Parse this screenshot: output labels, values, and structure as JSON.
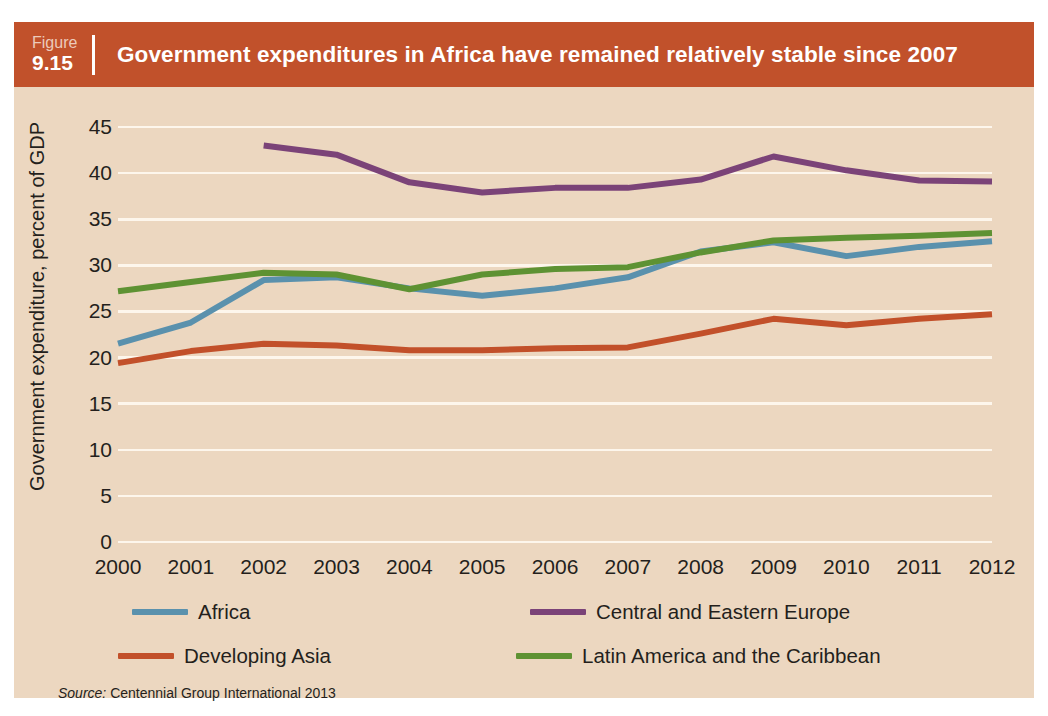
{
  "figure": {
    "label_word": "Figure",
    "number": "9.15",
    "title": "Government expenditures in Africa have remained relatively stable since 2007"
  },
  "source": {
    "keyword": "Source:",
    "text": "Centennial Group International 2013"
  },
  "colors": {
    "header_band": "#c1512b",
    "panel_background": "#ecd7c0",
    "gridline": "#fdf6ec",
    "text": "#241f1c",
    "africa": "#5a91ad",
    "central_and_eastern_europe": "#7b4378",
    "developing_asia": "#c2502a",
    "latin_america_and_the_caribbean": "#5e9233"
  },
  "chart_data": {
    "type": "line",
    "title": "Government expenditures in Africa have remained relatively stable since 2007",
    "xlabel": "",
    "ylabel": "Government expenditure, percent of GDP",
    "x": [
      2000,
      2001,
      2002,
      2003,
      2004,
      2005,
      2006,
      2007,
      2008,
      2009,
      2010,
      2011,
      2012
    ],
    "xtick_labels": [
      "2000",
      "2001",
      "2002",
      "2003",
      "2004",
      "2005",
      "2006",
      "2007",
      "2008",
      "2009",
      "2010",
      "2011",
      "2012"
    ],
    "ytick_labels": [
      "0",
      "5",
      "10",
      "15",
      "20",
      "25",
      "30",
      "35",
      "40",
      "45"
    ],
    "yticks": [
      0,
      5,
      10,
      15,
      20,
      25,
      30,
      35,
      40,
      45
    ],
    "ylim": [
      0,
      45
    ],
    "grid": "horizontal",
    "legend_position": "below-plot",
    "series": [
      {
        "name": "Africa",
        "color": "#5a91ad",
        "values": [
          21.5,
          23.8,
          28.4,
          28.7,
          27.5,
          26.7,
          27.5,
          28.7,
          31.5,
          32.5,
          31.0,
          32.0,
          32.6
        ]
      },
      {
        "name": "Central and Eastern Europe",
        "color": "#7b4378",
        "values": [
          null,
          null,
          43.0,
          42.0,
          39.0,
          37.9,
          38.4,
          38.4,
          39.3,
          41.8,
          40.3,
          39.2,
          39.1
        ]
      },
      {
        "name": "Developing Asia",
        "color": "#c2502a",
        "values": [
          19.4,
          20.7,
          21.5,
          21.3,
          20.8,
          20.8,
          21.0,
          21.1,
          22.6,
          24.2,
          23.5,
          24.2,
          24.7
        ]
      },
      {
        "name": "Latin America and the Caribbean",
        "color": "#5e9233",
        "values": [
          27.2,
          28.2,
          29.2,
          29.0,
          27.4,
          29.0,
          29.6,
          29.8,
          31.4,
          32.7,
          33.0,
          33.2,
          33.5
        ]
      }
    ]
  }
}
